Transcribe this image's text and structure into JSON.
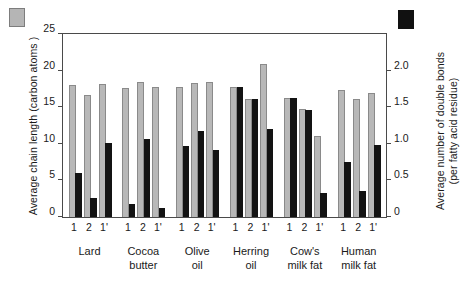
{
  "legend": {
    "gray_swatch_name": "gray-bar-legend-swatch",
    "black_swatch_name": "black-bar-legend-swatch",
    "gray_color": "#b8b8b8",
    "black_color": "#131313"
  },
  "axes": {
    "left_title": "Average chain length (carbon atoms )",
    "right_title_line1": "Average number of double bonds",
    "right_title_line2": "(per fatty acid residue)",
    "left_ticks": [
      "0",
      "5",
      "10",
      "15",
      "20",
      "25"
    ],
    "right_ticks": [
      "0",
      "0.5",
      "1.0",
      "1.5",
      "2.0"
    ],
    "left_min": 0,
    "left_max": 25,
    "right_min": 0,
    "right_max": 2.5
  },
  "chart_data": {
    "type": "bar",
    "title": "",
    "xlabel": "",
    "ylabel": "Average chain length (carbon atoms )",
    "y2label": "Average number of double bonds (per fatty acid residue)",
    "ylim": [
      0,
      25
    ],
    "y2lim": [
      0,
      2.5
    ],
    "grid": false,
    "legend": "swatches at top-left (gray) and top-right (black)",
    "positions": [
      "1",
      "2",
      "1'"
    ],
    "categories": [
      "Lard",
      "Cocoa butter",
      "Olive oil",
      "Herring oil",
      "Cow's milk fat",
      "Human milk fat"
    ],
    "series": [
      {
        "name": "Average chain length (carbon atoms)",
        "axis": "left",
        "color": "#b8b8b8",
        "values": [
          [
            18.1,
            16.7,
            18.2
          ],
          [
            17.6,
            18.4,
            17.8
          ],
          [
            17.8,
            18.3,
            18.4
          ],
          [
            17.7,
            16.1,
            20.9
          ],
          [
            16.3,
            14.7,
            11.1
          ],
          [
            17.4,
            16.1,
            16.9
          ]
        ]
      },
      {
        "name": "Average number of double bonds (per fatty acid residue)",
        "axis": "right",
        "color": "#131313",
        "values": [
          [
            0.6,
            0.26,
            1.01
          ],
          [
            0.18,
            1.06,
            0.12
          ],
          [
            0.97,
            1.17,
            0.92
          ],
          [
            1.77,
            1.61,
            1.2
          ],
          [
            1.62,
            1.46,
            0.33
          ],
          [
            0.75,
            0.35,
            0.98
          ]
        ]
      }
    ]
  }
}
